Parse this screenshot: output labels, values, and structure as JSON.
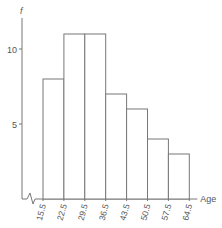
{
  "chart_data": {
    "type": "bar",
    "subtype": "histogram",
    "title": "",
    "xlabel": "Age",
    "ylabel": "f",
    "bin_edges": [
      15.5,
      22.5,
      29.5,
      36.5,
      43.5,
      50.5,
      57.5,
      64.5
    ],
    "tick_labels": [
      "15.5",
      "22.5",
      "29.5",
      "36.5",
      "43.5",
      "50.5",
      "57.5",
      "64.5"
    ],
    "categories": [
      "15.5-22.5",
      "22.5-29.5",
      "29.5-36.5",
      "36.5-43.5",
      "43.5-50.5",
      "50.5-57.5",
      "57.5-64.5"
    ],
    "values": [
      8,
      11,
      11,
      7,
      6,
      4,
      3
    ],
    "y_ticks": [
      5,
      10
    ],
    "ylim": [
      0,
      12
    ],
    "grid": false,
    "axis_break": true,
    "legend": null
  },
  "colors": {
    "stroke": "#777777",
    "text": "#555555",
    "fill": "#ffffff"
  }
}
